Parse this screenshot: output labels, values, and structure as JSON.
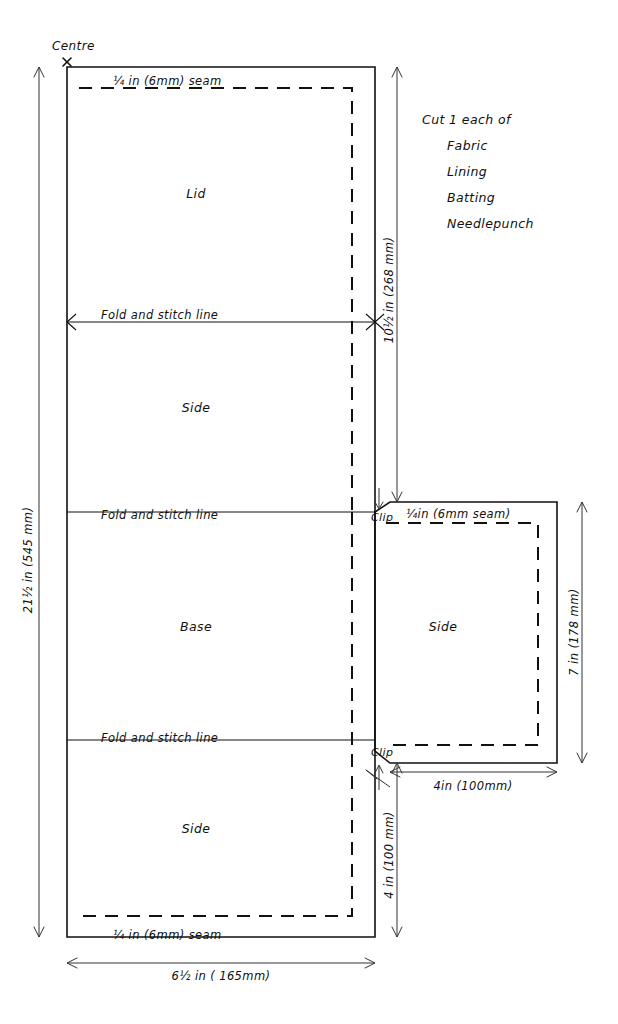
{
  "diagram": {
    "colors": {
      "ink": "#111111",
      "dimension": "#333333",
      "background": "#ffffff"
    },
    "centre_marker": {
      "label": "Centre",
      "symbol": "x"
    },
    "panels": [
      {
        "id": "lid",
        "label": "Lid"
      },
      {
        "id": "side-upper",
        "label": "Side"
      },
      {
        "id": "base",
        "label": "Base"
      },
      {
        "id": "side-lower",
        "label": "Side"
      },
      {
        "id": "side-right",
        "label": "Side"
      }
    ],
    "fold_lines": [
      {
        "id": "fold-1",
        "label": "Fold and stitch line"
      },
      {
        "id": "fold-2",
        "label": "Fold and stitch line"
      },
      {
        "id": "fold-3",
        "label": "Fold and stitch line"
      }
    ],
    "seam_labels": [
      {
        "id": "seam-top",
        "label": "¼ in  (6mm) seam"
      },
      {
        "id": "seam-right",
        "label": "¼in  (6mm seam)"
      },
      {
        "id": "seam-bottom",
        "label": "¼ in  (6mm) seam"
      }
    ],
    "clip_labels": [
      {
        "id": "clip-upper",
        "label": "Clip"
      },
      {
        "id": "clip-lower",
        "label": "Clip"
      }
    ],
    "cut_note": {
      "heading": "Cut 1 each of",
      "materials": [
        "Fabric",
        "Lining",
        "Batting",
        "Needlepunch"
      ]
    },
    "dimensions": [
      {
        "id": "dim-overall-height",
        "label": "21½ in  (545 mm)",
        "value_in": 21.5,
        "value_mm": 545,
        "orientation": "vertical",
        "position": "left"
      },
      {
        "id": "dim-lid-to-base",
        "label": "10½ in  (268 mm)",
        "value_in": 10.5,
        "value_mm": 268,
        "orientation": "vertical",
        "position": "inner-right"
      },
      {
        "id": "dim-side-right-height",
        "label": "7 in  (178 mm)",
        "value_in": 7,
        "value_mm": 178,
        "orientation": "vertical",
        "position": "far-right"
      },
      {
        "id": "dim-side-right-width",
        "label": "4in  (100mm)",
        "value_in": 4,
        "value_mm": 100,
        "orientation": "horizontal",
        "position": "right-bottom"
      },
      {
        "id": "dim-lower-side-height",
        "label": "4 in  (100 mm)",
        "value_in": 4,
        "value_mm": 100,
        "orientation": "vertical",
        "position": "inner-right-bottom"
      },
      {
        "id": "dim-overall-width",
        "label": "6½ in  ( 165mm)",
        "value_in": 6.5,
        "value_mm": 165,
        "orientation": "horizontal",
        "position": "bottom"
      }
    ]
  }
}
